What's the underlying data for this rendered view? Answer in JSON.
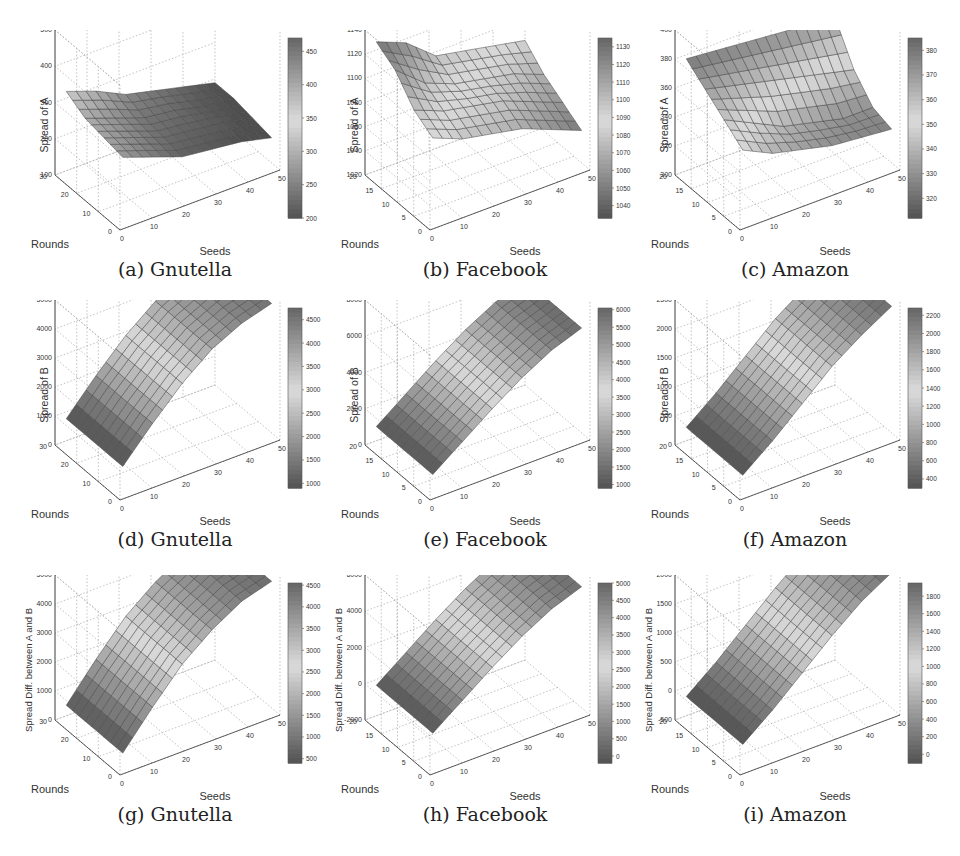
{
  "figure": {
    "panels": [
      {
        "id": "a",
        "tag": "(a)",
        "dataset": "Gnutella"
      },
      {
        "id": "b",
        "tag": "(b)",
        "dataset": "Facebook"
      },
      {
        "id": "c",
        "tag": "(c)",
        "dataset": "Amazon"
      },
      {
        "id": "d",
        "tag": "(d)",
        "dataset": "Gnutella"
      },
      {
        "id": "e",
        "tag": "(e)",
        "dataset": "Facebook"
      },
      {
        "id": "f",
        "tag": "(f)",
        "dataset": "Amazon"
      },
      {
        "id": "g",
        "tag": "(g)",
        "dataset": "Gnutella"
      },
      {
        "id": "h",
        "tag": "(h)",
        "dataset": "Facebook"
      },
      {
        "id": "i",
        "tag": "(i)",
        "dataset": "Amazon"
      }
    ]
  },
  "chart_data": [
    {
      "panel": "a",
      "type": "surface3d",
      "title": "(a) Gnutella",
      "xlabel": "Seeds",
      "ylabel": "Rounds",
      "zlabel": "Spread of A",
      "x_ticks": [
        "0",
        "10",
        "20",
        "30",
        "40",
        "50"
      ],
      "y_ticks": [
        "0",
        "10",
        "20",
        "30"
      ],
      "z_ticks": [
        "100",
        "200",
        "300",
        "400",
        "500"
      ],
      "zlim": [
        100,
        500
      ],
      "colorbar_ticks": [
        "200",
        "250",
        "300",
        "350",
        "400",
        "450"
      ],
      "colorbar_range": [
        200,
        470
      ],
      "shape": "decreasing",
      "grid": true,
      "rows": [
        [
          330,
          300,
          260,
          240,
          220,
          200
        ],
        [
          300,
          270,
          240,
          230,
          210,
          200
        ],
        [
          290,
          260,
          230,
          220,
          210,
          190
        ],
        [
          280,
          250,
          220,
          210,
          200,
          180
        ]
      ]
    },
    {
      "panel": "b",
      "type": "surface3d",
      "title": "(b) Facebook",
      "xlabel": "Seeds",
      "ylabel": "Rounds",
      "zlabel": "Spread of A",
      "x_ticks": [
        "0",
        "10",
        "20",
        "30",
        "40",
        "50"
      ],
      "y_ticks": [
        "0",
        "5",
        "10",
        "15",
        "20"
      ],
      "z_ticks": [
        "1020",
        "1040",
        "1060",
        "1080",
        "1100",
        "1120",
        "1140"
      ],
      "zlim": [
        1020,
        1140
      ],
      "colorbar_ticks": [
        "1040",
        "1050",
        "1060",
        "1070",
        "1080",
        "1090",
        "1100",
        "1110",
        "1120",
        "1130"
      ],
      "colorbar_range": [
        1033,
        1135
      ],
      "shape": "irregular",
      "grid": true,
      "rows": [
        [
          1130,
          1120,
          1100,
          1095,
          1090,
          1085
        ],
        [
          1120,
          1100,
          1090,
          1085,
          1080,
          1070
        ],
        [
          1100,
          1090,
          1085,
          1080,
          1070,
          1060
        ],
        [
          1090,
          1080,
          1075,
          1070,
          1060,
          1050
        ]
      ]
    },
    {
      "panel": "c",
      "type": "surface3d",
      "title": "(c) Amazon",
      "xlabel": "Seeds",
      "ylabel": "Rounds",
      "zlabel": "Spread of A",
      "x_ticks": [
        "0",
        "10",
        "20",
        "30",
        "40",
        "50"
      ],
      "y_ticks": [
        "0",
        "5",
        "10",
        "15",
        "20"
      ],
      "z_ticks": [
        "300",
        "320",
        "340",
        "360",
        "380",
        "400"
      ],
      "zlim": [
        300,
        400
      ],
      "colorbar_ticks": [
        "320",
        "330",
        "340",
        "350",
        "360",
        "370",
        "380"
      ],
      "colorbar_range": [
        312,
        385
      ],
      "shape": "irregular",
      "grid": true,
      "rows": [
        [
          380,
          378,
          376,
          374,
          372,
          370
        ],
        [
          370,
          365,
          360,
          355,
          350,
          345
        ],
        [
          360,
          350,
          340,
          335,
          330,
          330
        ],
        [
          350,
          340,
          335,
          330,
          328,
          326
        ]
      ]
    },
    {
      "panel": "d",
      "type": "surface3d",
      "title": "(d) Gnutella",
      "xlabel": "Seeds",
      "ylabel": "Rounds",
      "zlabel": "Spread of B",
      "x_ticks": [
        "0",
        "10",
        "20",
        "30",
        "40",
        "50"
      ],
      "y_ticks": [
        "0",
        "10",
        "20",
        "30"
      ],
      "z_ticks": [
        "0",
        "1000",
        "2000",
        "3000",
        "4000",
        "5000"
      ],
      "zlim": [
        0,
        5000
      ],
      "colorbar_ticks": [
        "1000",
        "1500",
        "2000",
        "2500",
        "3000",
        "3500",
        "4000",
        "4500"
      ],
      "colorbar_range": [
        900,
        4750
      ],
      "shape": "increasing-concave",
      "grid": true,
      "rows": [
        [
          900,
          2000,
          3000,
          3800,
          4300,
          4600
        ],
        [
          900,
          2000,
          3000,
          3800,
          4300,
          4600
        ],
        [
          900,
          2000,
          3000,
          3800,
          4300,
          4600
        ],
        [
          900,
          2000,
          3000,
          3800,
          4300,
          4600
        ]
      ]
    },
    {
      "panel": "e",
      "type": "surface3d",
      "title": "(e) Facebook",
      "xlabel": "Seeds",
      "ylabel": "Rounds",
      "zlabel": "Spread of B",
      "x_ticks": [
        "0",
        "10",
        "20",
        "30",
        "40",
        "50"
      ],
      "y_ticks": [
        "0",
        "5",
        "10",
        "15",
        "20"
      ],
      "z_ticks": [
        "0",
        "2000",
        "4000",
        "6000",
        "8000"
      ],
      "zlim": [
        0,
        8000
      ],
      "colorbar_ticks": [
        "1000",
        "1500",
        "2000",
        "2500",
        "3000",
        "3500",
        "4000",
        "4500",
        "5000",
        "5500",
        "6000"
      ],
      "colorbar_range": [
        900,
        6050
      ],
      "shape": "increasing",
      "grid": true,
      "rows": [
        [
          1000,
          2200,
          3400,
          4500,
          5400,
          6000
        ],
        [
          1000,
          2200,
          3400,
          4500,
          5400,
          6000
        ],
        [
          1000,
          2200,
          3400,
          4500,
          5400,
          6000
        ],
        [
          1000,
          2200,
          3400,
          4500,
          5400,
          6000
        ]
      ]
    },
    {
      "panel": "f",
      "type": "surface3d",
      "title": "(f) Amazon",
      "xlabel": "Seeds",
      "ylabel": "Rounds",
      "zlabel": "Spread of B",
      "x_ticks": [
        "0",
        "10",
        "20",
        "30",
        "40",
        "50"
      ],
      "y_ticks": [
        "0",
        "5",
        "10",
        "15",
        "20"
      ],
      "z_ticks": [
        "0",
        "500",
        "1000",
        "1500",
        "2000",
        "2500"
      ],
      "zlim": [
        0,
        2500
      ],
      "colorbar_ticks": [
        "400",
        "600",
        "800",
        "1000",
        "1200",
        "1400",
        "1600",
        "1800",
        "2000",
        "2200"
      ],
      "colorbar_range": [
        300,
        2280
      ],
      "shape": "increasing",
      "grid": true,
      "rows": [
        [
          300,
          700,
          1150,
          1600,
          1950,
          2250
        ],
        [
          300,
          700,
          1150,
          1600,
          1950,
          2250
        ],
        [
          300,
          700,
          1150,
          1600,
          1950,
          2250
        ],
        [
          300,
          700,
          1150,
          1600,
          1950,
          2250
        ]
      ]
    },
    {
      "panel": "g",
      "type": "surface3d",
      "title": "(g) Gnutella",
      "xlabel": "Seeds",
      "ylabel": "Rounds",
      "zlabel": "Spread Diff. between A and B",
      "x_ticks": [
        "0",
        "10",
        "20",
        "30",
        "40",
        "50"
      ],
      "y_ticks": [
        "0",
        "10",
        "20",
        "30"
      ],
      "z_ticks": [
        "0",
        "1000",
        "2000",
        "3000",
        "4000",
        "5000"
      ],
      "zlim": [
        0,
        5000
      ],
      "colorbar_ticks": [
        "500",
        "1000",
        "1500",
        "2000",
        "2500",
        "3000",
        "3500",
        "4000",
        "4500"
      ],
      "colorbar_range": [
        400,
        4550
      ],
      "shape": "increasing-concave",
      "grid": true,
      "rows": [
        [
          500,
          1700,
          2800,
          3600,
          4200,
          4500
        ],
        [
          500,
          1700,
          2800,
          3600,
          4200,
          4500
        ],
        [
          500,
          1700,
          2800,
          3600,
          4200,
          4500
        ],
        [
          500,
          1700,
          2800,
          3600,
          4200,
          4500
        ]
      ]
    },
    {
      "panel": "h",
      "type": "surface3d",
      "title": "(h) Facebook",
      "xlabel": "Seeds",
      "ylabel": "Rounds",
      "zlabel": "Spread Diff. between A and B",
      "x_ticks": [
        "0",
        "10",
        "20",
        "30",
        "40",
        "50"
      ],
      "y_ticks": [
        "0",
        "5",
        "10",
        "15",
        "20"
      ],
      "z_ticks": [
        "-2000",
        "0",
        "2000",
        "4000",
        "6000"
      ],
      "zlim": [
        -2000,
        6000
      ],
      "colorbar_ticks": [
        "0",
        "500",
        "1000",
        "1500",
        "2000",
        "2500",
        "3000",
        "3500",
        "4000",
        "4500",
        "5000"
      ],
      "colorbar_range": [
        -200,
        5000
      ],
      "shape": "increasing",
      "grid": true,
      "rows": [
        [
          -100,
          1100,
          2300,
          3400,
          4300,
          4900
        ],
        [
          -100,
          1100,
          2300,
          3400,
          4300,
          4900
        ],
        [
          -100,
          1100,
          2300,
          3400,
          4300,
          4900
        ],
        [
          -100,
          1100,
          2300,
          3400,
          4300,
          4900
        ]
      ]
    },
    {
      "panel": "i",
      "type": "surface3d",
      "title": "(i) Amazon",
      "xlabel": "Seeds",
      "ylabel": "Rounds",
      "zlabel": "Spread Diff. between A and B",
      "x_ticks": [
        "0",
        "10",
        "20",
        "30",
        "40",
        "50"
      ],
      "y_ticks": [
        "0",
        "5",
        "10",
        "15",
        "20"
      ],
      "z_ticks": [
        "-500",
        "0",
        "500",
        "1000",
        "1500",
        "2000"
      ],
      "zlim": [
        -500,
        2000
      ],
      "colorbar_ticks": [
        "0",
        "200",
        "400",
        "600",
        "800",
        "1000",
        "1200",
        "1400",
        "1600",
        "1800"
      ],
      "colorbar_range": [
        -100,
        1950
      ],
      "shape": "increasing",
      "grid": true,
      "rows": [
        [
          -100,
          300,
          750,
          1200,
          1600,
          1900
        ],
        [
          -100,
          300,
          750,
          1200,
          1600,
          1900
        ],
        [
          -100,
          300,
          750,
          1200,
          1600,
          1900
        ],
        [
          -100,
          300,
          750,
          1200,
          1600,
          1900
        ]
      ]
    }
  ]
}
